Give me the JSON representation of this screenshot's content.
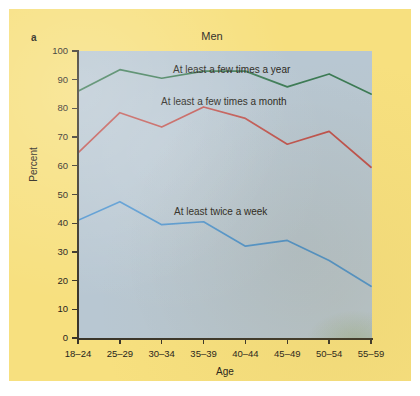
{
  "figure": {
    "panel_label": "a",
    "title": "Men",
    "card_color": "#f7e07f",
    "plot_background": "#b8c7d2",
    "page_background": "#ffffff"
  },
  "chart_data": {
    "type": "line",
    "title": "Men",
    "xlabel": "Age",
    "ylabel": "Percent",
    "ylim": [
      0,
      100
    ],
    "yticks": [
      0,
      10,
      20,
      30,
      40,
      50,
      60,
      70,
      80,
      90,
      100
    ],
    "grid": false,
    "legend_position": "inline-annotations",
    "categories": [
      "18–24",
      "25–29",
      "30–34",
      "35–39",
      "40–44",
      "45–49",
      "50–54",
      "55–59"
    ],
    "series": [
      {
        "name": "At least a few times a year",
        "color": "#3b7a54",
        "values": [
          86,
          93.5,
          90.5,
          93,
          93,
          87.5,
          92,
          85
        ]
      },
      {
        "name": "At least a few times a month",
        "color": "#c0524d",
        "values": [
          64.5,
          78.5,
          73.5,
          80.5,
          76.5,
          67.5,
          72,
          59.5
        ]
      },
      {
        "name": "At least twice a week",
        "color": "#4f95d0",
        "values": [
          41,
          47.5,
          39.5,
          40.5,
          32,
          34,
          27,
          18
        ]
      }
    ]
  }
}
